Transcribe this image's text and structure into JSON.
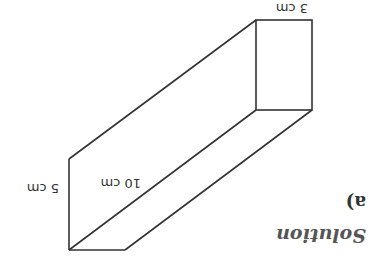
{
  "heading": "Solution",
  "part_label": "a)",
  "figure": {
    "type": "cuboid",
    "labels": {
      "height": "5 cm",
      "length": "10 cm",
      "width": "3 cm"
    },
    "line_color": "#333333"
  },
  "orientation": "rotated 180 degrees"
}
